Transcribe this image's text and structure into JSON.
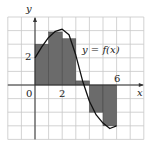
{
  "diagram": {
    "type": "riemann-sum",
    "curve_label": "y = f(x)",
    "axis_x_label": "x",
    "axis_y_label": "y",
    "origin_label": "0",
    "tick_labels": {
      "x": [
        "2",
        "6"
      ],
      "y": [
        "2"
      ]
    },
    "grid": {
      "xmin": -2,
      "xmax": 8,
      "ymin": -4,
      "ymax": 5,
      "step": 1
    },
    "rectangles": [
      {
        "x0": 0,
        "x1": 1,
        "height": 3.0
      },
      {
        "x0": 1,
        "x1": 2,
        "height": 3.9
      },
      {
        "x0": 2,
        "x1": 3,
        "height": 3.4
      },
      {
        "x0": 3,
        "x1": 4,
        "height": 0.3
      },
      {
        "x0": 4,
        "x1": 5,
        "height": -2.0
      },
      {
        "x0": 5,
        "x1": 6,
        "height": -3.0
      }
    ],
    "colors": {
      "fill": "#6b6b6b",
      "grid": "#c8c8c8",
      "axis": "#333333",
      "curve": "#111111"
    }
  }
}
